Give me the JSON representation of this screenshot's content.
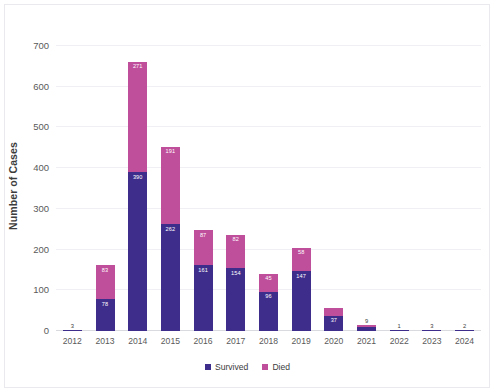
{
  "chart_data": {
    "type": "bar",
    "stacked": true,
    "title": "",
    "xlabel": "",
    "ylabel": "Number of Cases",
    "ylim": [
      0,
      700
    ],
    "yticks": [
      0,
      100,
      200,
      300,
      400,
      500,
      600,
      700
    ],
    "grid": true,
    "legend_position": "bottom",
    "categories": [
      "2012",
      "2013",
      "2014",
      "2015",
      "2016",
      "2017",
      "2018",
      "2019",
      "2020",
      "2021",
      "2022",
      "2023",
      "2024"
    ],
    "series": [
      {
        "name": "Survived",
        "color": "#3f2d8c",
        "values": [
          3,
          78,
          390,
          262,
          161,
          154,
          96,
          147,
          37,
          9,
          1,
          3,
          2
        ],
        "labels": [
          "",
          "78",
          "390",
          "262",
          "161",
          "154",
          "96",
          "147",
          "37",
          "",
          "",
          "",
          ""
        ]
      },
      {
        "name": "Died",
        "color": "#bf4e9b",
        "values": [
          0,
          83,
          271,
          191,
          87,
          82,
          45,
          58,
          20,
          5,
          0,
          0,
          0
        ],
        "labels": [
          "",
          "83",
          "271",
          "191",
          "87",
          "82",
          "45",
          "58",
          "",
          "",
          "",
          "",
          ""
        ]
      }
    ],
    "totals": [
      3,
      161,
      661,
      453,
      248,
      236,
      141,
      205,
      57,
      14,
      1,
      3,
      2
    ],
    "total_labels": [
      "3",
      "",
      "",
      "",
      "",
      "",
      "",
      "",
      "",
      "9",
      "1",
      "3",
      "2"
    ]
  },
  "legend": {
    "items": [
      {
        "label": "Survived",
        "color": "#3f2d8c",
        "icon": "square-swatch-icon"
      },
      {
        "label": "Died",
        "color": "#bf4e9b",
        "icon": "square-swatch-icon"
      }
    ]
  }
}
